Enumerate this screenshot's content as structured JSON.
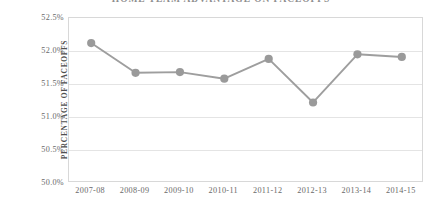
{
  "chart_data": {
    "type": "line",
    "title": "HOME TEAM ADVANTAGE ON FACEOFFS",
    "xlabel": "",
    "ylabel_lines": [
      "PERCENTAGE OF FACEOFFS",
      "WON BY HOME TEAM"
    ],
    "categories": [
      "2007-08",
      "2008-09",
      "2009-10",
      "2010-11",
      "2011-12",
      "2012-13",
      "2013-14",
      "2014-15"
    ],
    "values": [
      52.12,
      51.67,
      51.68,
      51.58,
      51.88,
      51.22,
      51.95,
      51.91
    ],
    "value_labels": [
      "52.12%",
      "51.67%",
      "51.68%",
      "51.58%",
      "51.88%",
      "51.22%",
      "51.95%",
      "51.91%"
    ],
    "ylim": [
      50.0,
      52.5
    ],
    "yticks": [
      52.5,
      52.0,
      51.5,
      51.0,
      50.5,
      50.0
    ],
    "ytick_labels": [
      "52.5%",
      "52.0%",
      "51.5%",
      "51.0%",
      "50.5%",
      "50.0%"
    ],
    "grid": true,
    "legend": "none",
    "series_name": "Percentage of faceoffs won by home team",
    "colors": {
      "line": "#9e9e9e",
      "marker": "#9a9a9a",
      "grid": "#e4e4e4",
      "axis": "#d8d8d8",
      "text": "#6a6a6a",
      "title": "#8d8d8d"
    }
  }
}
